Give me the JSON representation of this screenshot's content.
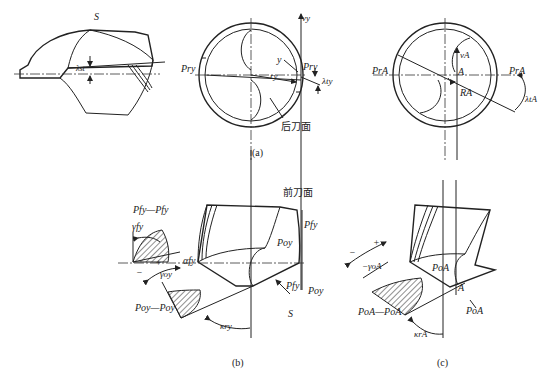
{
  "figure": {
    "panels": [
      {
        "id": "a-left",
        "labels": {
          "surface": "S",
          "lambda": "λst"
        }
      },
      {
        "id": "a-mid",
        "labels": {
          "v": "vy",
          "p_left": "Pry",
          "p_right": "Pry",
          "y": "y",
          "r": "ry",
          "lambda": "λty",
          "flank": "后刀面"
        },
        "caption": "(a)"
      },
      {
        "id": "a-right",
        "labels": {
          "v": "vA",
          "a": "A",
          "r": "RA",
          "p_left": "PrA",
          "p_right": "PrA",
          "lambda": "λtA"
        }
      },
      {
        "id": "b",
        "labels": {
          "rake_face": "前刀面",
          "section_f": "Pfy—Pfy",
          "gamma_f": "γfy",
          "alpha_f": "αfy",
          "plus": "+",
          "minus": "−",
          "gamma_o": "γoy",
          "section_o": "Poy—Poy",
          "kappa": "κry",
          "pf_top": "Pfy",
          "po_mid": "Poy",
          "pf_bot": "Pfy",
          "po_bot": "Poy",
          "surface": "S"
        },
        "caption": "(b)"
      },
      {
        "id": "c",
        "labels": {
          "plus": "+",
          "minus": "−",
          "gamma_o": "−γoA",
          "po_mid": "PoA",
          "a": "A",
          "section_o": "PoA—PoA",
          "po_bot": "PoA",
          "kappa": "κrA"
        },
        "caption": "(c)"
      }
    ]
  }
}
